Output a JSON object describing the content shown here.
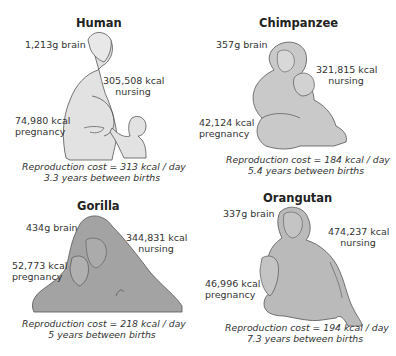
{
  "panels": {
    "human": {
      "title": "Human",
      "brain": "1,213g brain",
      "nursing_value": "305,508 kcal",
      "nursing_label": "nursing",
      "pregnancy_value": "74,980 kcal",
      "pregnancy_label": "pregnancy",
      "cost": "Reproduction cost = 313 kcal / day",
      "interval": "3.3 years between births",
      "fill": "#e2e2e2"
    },
    "chimpanzee": {
      "title": "Chimpanzee",
      "brain": "357g brain",
      "nursing_value": "321,815 kcal",
      "nursing_label": "nursing",
      "pregnancy_value": "42,124 kcal",
      "pregnancy_label": "pregnancy",
      "cost": "Reproduction cost = 184 kcal / day",
      "interval": "5.4 years between births",
      "fill": "#c9c9c9"
    },
    "gorilla": {
      "title": "Gorilla",
      "brain": "434g brain",
      "nursing_value": "344,831 kcal",
      "nursing_label": "nursing",
      "pregnancy_value": "52,773 kcal",
      "pregnancy_label": "pregnancy",
      "cost": "Reproduction cost = 218 kcal / day",
      "interval": "5 years between births",
      "fill": "#a3a3a3"
    },
    "orangutan": {
      "title": "Orangutan",
      "brain": "337g brain",
      "nursing_value": "474,237 kcal",
      "nursing_label": "nursing",
      "pregnancy_value": "46,996 kcal",
      "pregnancy_label": "pregnancy",
      "cost": "Reproduction cost = 194 kcal / day",
      "interval": "7.3 years between births",
      "fill": "#bababa"
    }
  },
  "stroke_color": "#555555"
}
